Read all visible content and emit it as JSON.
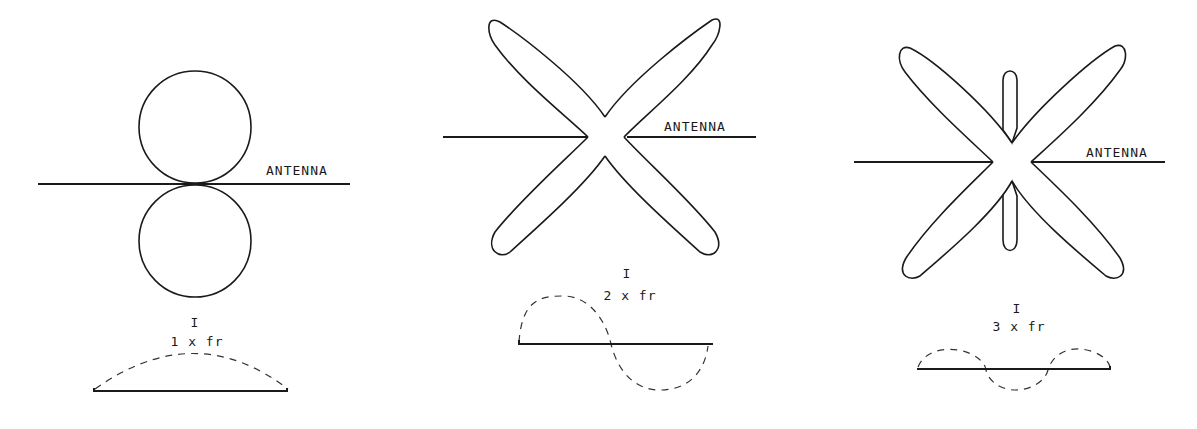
{
  "diagram": {
    "colors": {
      "stroke": "#1a1a1a",
      "background": "#ffffff"
    },
    "panels": [
      {
        "antenna_label": "ANTENNA",
        "current_label": "I",
        "frequency_label": "1 x fr",
        "pattern": "two circular lobes perpendicular to antenna",
        "current_distribution": "half sine wave"
      },
      {
        "antenna_label": "ANTENNA",
        "current_label": "I",
        "frequency_label": "2 x fr",
        "pattern": "four diagonal lobes",
        "current_distribution": "full sine wave"
      },
      {
        "antenna_label": "ANTENNA",
        "current_label": "I",
        "frequency_label": "3 x fr",
        "pattern": "four diagonal lobes plus two small perpendicular lobes",
        "current_distribution": "one and a half sine waves"
      }
    ]
  }
}
